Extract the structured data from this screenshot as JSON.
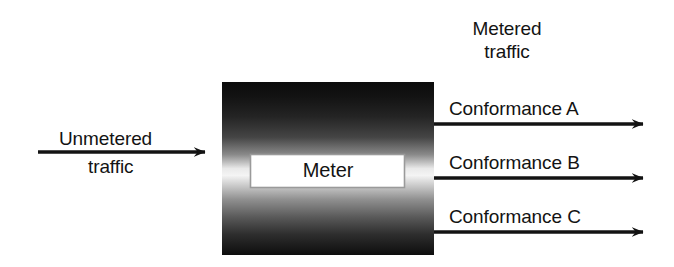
{
  "diagram": {
    "type": "block-flow",
    "canvas": {
      "width": 674,
      "height": 267,
      "background": "#ffffff"
    },
    "meter_block": {
      "label": "Meter",
      "x": 222,
      "y": 82,
      "width": 212,
      "height": 173,
      "fill_description": "vertical gradient dark-to-light-to-dark",
      "gradient_stops": [
        "#0d0d0d",
        "#2a2a2a",
        "#f2f2f2",
        "#3a3a3a",
        "#0f0f0f"
      ],
      "inner_plate": {
        "x": 250,
        "y": 154,
        "width": 155,
        "height": 34,
        "fill": "#ffffff",
        "border_color": "#9a9a9a"
      }
    },
    "input": {
      "label_line_1": "Unmetered",
      "label_line_2": "traffic",
      "arrow": {
        "x1": 38,
        "y1": 152,
        "x2": 207,
        "y2": 152
      }
    },
    "output_group_label": {
      "line_1": "Metered",
      "line_2": "traffic"
    },
    "outputs": [
      {
        "label": "Conformance A",
        "arrow": {
          "x1": 434,
          "y1": 124,
          "x2": 645,
          "y2": 124
        }
      },
      {
        "label": "Conformance B",
        "arrow": {
          "x1": 434,
          "y1": 178,
          "x2": 645,
          "y2": 178
        }
      },
      {
        "label": "Conformance C",
        "arrow": {
          "x1": 434,
          "y1": 232,
          "x2": 645,
          "y2": 232
        }
      }
    ],
    "colors": {
      "stroke": "#131313",
      "text": "#131313",
      "background": "#ffffff",
      "plate_fill": "#ffffff"
    }
  }
}
